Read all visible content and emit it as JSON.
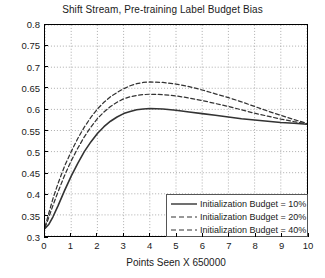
{
  "chart_data": {
    "type": "line",
    "title": "Shift Stream, Pre-training Label Budget Bias",
    "xlabel": "Points Seen X 650000",
    "ylabel": "",
    "xlim": [
      0,
      10
    ],
    "ylim": [
      0.3,
      0.8
    ],
    "xticks": [
      0,
      1,
      2,
      3,
      4,
      5,
      6,
      7,
      8,
      9,
      10
    ],
    "xtick_labels": [
      "0",
      "1",
      "2",
      "3",
      "4",
      "5",
      "6",
      "7",
      "8",
      "9",
      "10"
    ],
    "yticks": [
      0.3,
      0.35,
      0.4,
      0.45,
      0.5,
      0.55,
      0.6,
      0.65,
      0.7,
      0.75,
      0.8
    ],
    "ytick_labels": [
      "0.3",
      "0.35",
      "0.4",
      "0.45",
      "0.5",
      "0.55",
      "0.6",
      "0.65",
      "0.7",
      "0.75",
      "0.8"
    ],
    "grid": true,
    "grid_style": "dotted",
    "legend_position": "lower right",
    "line_color": "#333333",
    "series": [
      {
        "name": "Initialization Budget = 10%",
        "style": "solid",
        "x": [
          0,
          0.15,
          0.3,
          0.5,
          0.75,
          1.0,
          1.25,
          1.5,
          1.75,
          2.0,
          2.25,
          2.5,
          2.75,
          3.0,
          3.25,
          3.5,
          3.75,
          4.0,
          4.5,
          5.0,
          5.5,
          6.0,
          6.5,
          7.0,
          7.5,
          8.0,
          8.5,
          9.0,
          9.5,
          10.0
        ],
        "values": [
          0.318,
          0.328,
          0.345,
          0.372,
          0.408,
          0.442,
          0.472,
          0.5,
          0.523,
          0.543,
          0.559,
          0.572,
          0.582,
          0.59,
          0.595,
          0.599,
          0.601,
          0.602,
          0.601,
          0.598,
          0.594,
          0.59,
          0.586,
          0.582,
          0.578,
          0.575,
          0.572,
          0.569,
          0.567,
          0.565
        ]
      },
      {
        "name": "Initialization Budget = 20%",
        "style": "dashed",
        "x": [
          0,
          0.15,
          0.3,
          0.5,
          0.75,
          1.0,
          1.25,
          1.5,
          1.75,
          2.0,
          2.25,
          2.5,
          2.75,
          3.0,
          3.25,
          3.5,
          3.75,
          4.0,
          4.5,
          5.0,
          5.5,
          6.0,
          6.5,
          7.0,
          7.5,
          8.0,
          8.5,
          9.0,
          9.5,
          10.0
        ],
        "values": [
          0.32,
          0.345,
          0.372,
          0.405,
          0.444,
          0.478,
          0.508,
          0.535,
          0.558,
          0.578,
          0.594,
          0.607,
          0.617,
          0.625,
          0.63,
          0.633,
          0.635,
          0.636,
          0.635,
          0.632,
          0.627,
          0.621,
          0.614,
          0.607,
          0.599,
          0.591,
          0.584,
          0.577,
          0.571,
          0.566
        ]
      },
      {
        "name": "Initialization Budget = 40%",
        "style": "dashed",
        "x": [
          0,
          0.15,
          0.3,
          0.5,
          0.75,
          1.0,
          1.25,
          1.5,
          1.75,
          2.0,
          2.25,
          2.5,
          2.75,
          3.0,
          3.25,
          3.5,
          3.75,
          4.0,
          4.5,
          5.0,
          5.5,
          6.0,
          6.5,
          7.0,
          7.5,
          8.0,
          8.5,
          9.0,
          9.5,
          10.0
        ],
        "values": [
          0.322,
          0.355,
          0.388,
          0.425,
          0.466,
          0.5,
          0.531,
          0.558,
          0.581,
          0.601,
          0.617,
          0.63,
          0.64,
          0.649,
          0.656,
          0.661,
          0.664,
          0.665,
          0.664,
          0.66,
          0.654,
          0.646,
          0.637,
          0.628,
          0.618,
          0.607,
          0.596,
          0.586,
          0.576,
          0.567
        ]
      }
    ]
  },
  "legend": {
    "items": [
      {
        "label": "Initialization Budget = 10%"
      },
      {
        "label": "Initialization Budget = 20%"
      },
      {
        "label": "Initialization Budget = 40%"
      }
    ]
  }
}
